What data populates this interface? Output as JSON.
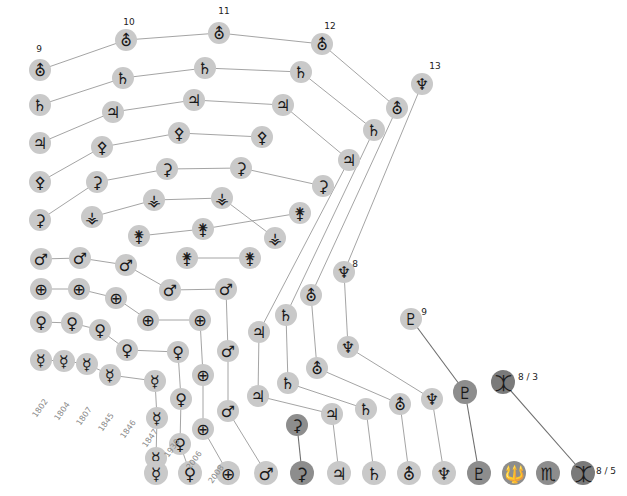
{
  "figure": {
    "type": "diagram-timeline-graph"
  },
  "glyphs": {
    "mercury": "☿",
    "venus": "♀",
    "earth": "⊕",
    "mars": "♂",
    "vesta": "⚶",
    "juno": "⚵",
    "pallas": "⚴",
    "ceres": "⚳",
    "jupiter": "♃",
    "saturn": "♄",
    "uranus": "⛢",
    "neptune": "♆",
    "pluto": "♇",
    "haumea": "🔱",
    "makemake": "♏",
    "eris": "⯰"
  },
  "glyph_names": {
    "mercury": "mercury-symbol",
    "venus": "venus-symbol",
    "earth": "earth-symbol",
    "mars": "mars-symbol",
    "vesta": "vesta-symbol",
    "juno": "juno-symbol",
    "pallas": "pallas-symbol",
    "ceres": "ceres-symbol",
    "jupiter": "jupiter-symbol",
    "saturn": "saturn-symbol",
    "uranus": "uranus-symbol",
    "neptune": "neptune-symbol",
    "pluto": "pluto-symbol",
    "haumea": "haumea-symbol",
    "makemake": "makemake-symbol",
    "eris": "eris-symbol"
  },
  "years": [
    {
      "text": "1802",
      "x": 46,
      "y": 400
    },
    {
      "text": "1804",
      "x": 68,
      "y": 403
    },
    {
      "text": "1807",
      "x": 90,
      "y": 408
    },
    {
      "text": "1845",
      "x": 112,
      "y": 414
    },
    {
      "text": "1846",
      "x": 134,
      "y": 421
    },
    {
      "text": "1847",
      "x": 156,
      "y": 430
    },
    {
      "text": "1930",
      "x": 178,
      "y": 440
    },
    {
      "text": "2006",
      "x": 200,
      "y": 452
    },
    {
      "text": "2008",
      "x": 222,
      "y": 466
    }
  ],
  "counts": [
    {
      "text": "9",
      "x": 39,
      "y": 49
    },
    {
      "text": "10",
      "x": 129,
      "y": 22
    },
    {
      "text": "11",
      "x": 224,
      "y": 11
    },
    {
      "text": "12",
      "x": 330,
      "y": 26
    },
    {
      "text": "13",
      "x": 435,
      "y": 66
    },
    {
      "text": "8",
      "x": 355,
      "y": 264
    },
    {
      "text": "9",
      "x": 424,
      "y": 312
    },
    {
      "text": "8 / 3",
      "x": 528,
      "y": 377
    },
    {
      "text": "8 / 5",
      "x": 606,
      "y": 471
    }
  ],
  "nodes": [
    {
      "id": "u9",
      "glyph": "uranus",
      "x": 40,
      "y": 70,
      "r": 11,
      "tone": "light"
    },
    {
      "id": "s9",
      "glyph": "saturn",
      "x": 40,
      "y": 105,
      "r": 11,
      "tone": "light"
    },
    {
      "id": "j9",
      "glyph": "jupiter",
      "x": 40,
      "y": 143,
      "r": 11,
      "tone": "light"
    },
    {
      "id": "p9",
      "glyph": "pallas",
      "x": 40,
      "y": 182,
      "r": 11,
      "tone": "light"
    },
    {
      "id": "c9",
      "glyph": "ceres",
      "x": 40,
      "y": 220,
      "r": 11,
      "tone": "light"
    },
    {
      "id": "m9",
      "glyph": "mars",
      "x": 41,
      "y": 259,
      "r": 11,
      "tone": "light"
    },
    {
      "id": "e9",
      "glyph": "earth",
      "x": 41,
      "y": 289,
      "r": 11,
      "tone": "light"
    },
    {
      "id": "v9",
      "glyph": "venus",
      "x": 41,
      "y": 322,
      "r": 11,
      "tone": "light"
    },
    {
      "id": "me9",
      "glyph": "mercury",
      "x": 41,
      "y": 360,
      "r": 11,
      "tone": "light"
    },
    {
      "id": "u10",
      "glyph": "uranus",
      "x": 126,
      "y": 40,
      "r": 11,
      "tone": "light"
    },
    {
      "id": "s10",
      "glyph": "saturn",
      "x": 123,
      "y": 78,
      "r": 11,
      "tone": "light"
    },
    {
      "id": "j10",
      "glyph": "jupiter",
      "x": 113,
      "y": 112,
      "r": 11,
      "tone": "light"
    },
    {
      "id": "p10",
      "glyph": "pallas",
      "x": 102,
      "y": 147,
      "r": 11,
      "tone": "light"
    },
    {
      "id": "c10",
      "glyph": "ceres",
      "x": 97,
      "y": 182,
      "r": 11,
      "tone": "light"
    },
    {
      "id": "ve10",
      "glyph": "vesta",
      "x": 92,
      "y": 217,
      "r": 11,
      "tone": "light"
    },
    {
      "id": "m10",
      "glyph": "mars",
      "x": 80,
      "y": 258,
      "r": 11,
      "tone": "light"
    },
    {
      "id": "e10",
      "glyph": "earth",
      "x": 79,
      "y": 289,
      "r": 11,
      "tone": "light"
    },
    {
      "id": "v10",
      "glyph": "venus",
      "x": 72,
      "y": 323,
      "r": 11,
      "tone": "light"
    },
    {
      "id": "me10",
      "glyph": "mercury",
      "x": 64,
      "y": 361,
      "r": 11,
      "tone": "light"
    },
    {
      "id": "u11",
      "glyph": "uranus",
      "x": 219,
      "y": 33,
      "r": 11,
      "tone": "light"
    },
    {
      "id": "s11",
      "glyph": "saturn",
      "x": 205,
      "y": 68,
      "r": 11,
      "tone": "light"
    },
    {
      "id": "j11",
      "glyph": "jupiter",
      "x": 194,
      "y": 100,
      "r": 11,
      "tone": "light"
    },
    {
      "id": "p11",
      "glyph": "pallas",
      "x": 179,
      "y": 133,
      "r": 11,
      "tone": "light"
    },
    {
      "id": "c11",
      "glyph": "ceres",
      "x": 167,
      "y": 169,
      "r": 11,
      "tone": "light"
    },
    {
      "id": "ve11",
      "glyph": "vesta",
      "x": 154,
      "y": 200,
      "r": 11,
      "tone": "light"
    },
    {
      "id": "ju11",
      "glyph": "juno",
      "x": 139,
      "y": 236,
      "r": 11,
      "tone": "light"
    },
    {
      "id": "m11",
      "glyph": "mars",
      "x": 126,
      "y": 265,
      "r": 11,
      "tone": "light"
    },
    {
      "id": "e11",
      "glyph": "earth",
      "x": 116,
      "y": 298,
      "r": 11,
      "tone": "light"
    },
    {
      "id": "v11",
      "glyph": "venus",
      "x": 100,
      "y": 330,
      "r": 11,
      "tone": "light"
    },
    {
      "id": "me11",
      "glyph": "mercury",
      "x": 87,
      "y": 364,
      "r": 11,
      "tone": "light"
    },
    {
      "id": "s12",
      "glyph": "saturn",
      "x": 301,
      "y": 72,
      "r": 11,
      "tone": "light"
    },
    {
      "id": "j12",
      "glyph": "jupiter",
      "x": 283,
      "y": 105,
      "r": 11,
      "tone": "light"
    },
    {
      "id": "p12",
      "glyph": "pallas",
      "x": 262,
      "y": 137,
      "r": 11,
      "tone": "light"
    },
    {
      "id": "c12",
      "glyph": "ceres",
      "x": 241,
      "y": 168,
      "r": 11,
      "tone": "light"
    },
    {
      "id": "ve12",
      "glyph": "vesta",
      "x": 222,
      "y": 198,
      "r": 11,
      "tone": "light"
    },
    {
      "id": "ju12",
      "glyph": "juno",
      "x": 203,
      "y": 229,
      "r": 11,
      "tone": "light"
    },
    {
      "id": "pa12",
      "glyph": "juno",
      "x": 187,
      "y": 258,
      "r": 11,
      "tone": "light"
    },
    {
      "id": "m12",
      "glyph": "mars",
      "x": 170,
      "y": 290,
      "r": 11,
      "tone": "light"
    },
    {
      "id": "e12",
      "glyph": "earth",
      "x": 148,
      "y": 320,
      "r": 11,
      "tone": "light"
    },
    {
      "id": "v12",
      "glyph": "venus",
      "x": 127,
      "y": 350,
      "r": 11,
      "tone": "light"
    },
    {
      "id": "me12",
      "glyph": "mercury",
      "x": 110,
      "y": 375,
      "r": 11,
      "tone": "light"
    },
    {
      "id": "u12",
      "glyph": "uranus",
      "x": 322,
      "y": 44,
      "r": 11,
      "tone": "light"
    },
    {
      "id": "n13",
      "glyph": "neptune",
      "x": 422,
      "y": 84,
      "r": 11,
      "tone": "light"
    },
    {
      "id": "u13",
      "glyph": "uranus",
      "x": 397,
      "y": 108,
      "r": 11,
      "tone": "light"
    },
    {
      "id": "s13",
      "glyph": "saturn",
      "x": 374,
      "y": 130,
      "r": 11,
      "tone": "light"
    },
    {
      "id": "j13",
      "glyph": "jupiter",
      "x": 349,
      "y": 160,
      "r": 11,
      "tone": "light"
    },
    {
      "id": "c13",
      "glyph": "ceres",
      "x": 323,
      "y": 186,
      "r": 11,
      "tone": "light"
    },
    {
      "id": "ve13",
      "glyph": "vesta",
      "x": 275,
      "y": 238,
      "r": 11,
      "tone": "light"
    },
    {
      "id": "ju13",
      "glyph": "juno",
      "x": 250,
      "y": 258,
      "r": 11,
      "tone": "light"
    },
    {
      "id": "pa13",
      "glyph": "juno",
      "x": 300,
      "y": 213,
      "r": 11,
      "tone": "light"
    },
    {
      "id": "m13",
      "glyph": "mars",
      "x": 226,
      "y": 289,
      "r": 11,
      "tone": "light"
    },
    {
      "id": "e13",
      "glyph": "earth",
      "x": 200,
      "y": 320,
      "r": 11,
      "tone": "light"
    },
    {
      "id": "v13",
      "glyph": "venus",
      "x": 178,
      "y": 352,
      "r": 11,
      "tone": "light"
    },
    {
      "id": "me13",
      "glyph": "mercury",
      "x": 155,
      "y": 381,
      "r": 11,
      "tone": "light"
    },
    {
      "id": "n8",
      "glyph": "neptune",
      "x": 344,
      "y": 272,
      "r": 11,
      "tone": "light"
    },
    {
      "id": "u8",
      "glyph": "uranus",
      "x": 311,
      "y": 295,
      "r": 11,
      "tone": "light"
    },
    {
      "id": "s8",
      "glyph": "saturn",
      "x": 286,
      "y": 315,
      "r": 11,
      "tone": "light"
    },
    {
      "id": "j8",
      "glyph": "jupiter",
      "x": 259,
      "y": 332,
      "r": 11,
      "tone": "light"
    },
    {
      "id": "m8",
      "glyph": "mars",
      "x": 228,
      "y": 351,
      "r": 11,
      "tone": "light"
    },
    {
      "id": "e8",
      "glyph": "earth",
      "x": 203,
      "y": 375,
      "r": 11,
      "tone": "light"
    },
    {
      "id": "v8",
      "glyph": "venus",
      "x": 181,
      "y": 399,
      "r": 11,
      "tone": "light"
    },
    {
      "id": "me8",
      "glyph": "mercury",
      "x": 157,
      "y": 418,
      "r": 11,
      "tone": "light"
    },
    {
      "id": "p9n",
      "glyph": "pluto",
      "x": 411,
      "y": 319,
      "r": 11,
      "tone": "light"
    },
    {
      "id": "n9",
      "glyph": "neptune",
      "x": 348,
      "y": 347,
      "r": 11,
      "tone": "light"
    },
    {
      "id": "u9b",
      "glyph": "uranus",
      "x": 317,
      "y": 368,
      "r": 11,
      "tone": "light"
    },
    {
      "id": "s9b",
      "glyph": "saturn",
      "x": 288,
      "y": 383,
      "r": 11,
      "tone": "light"
    },
    {
      "id": "j9b",
      "glyph": "jupiter",
      "x": 258,
      "y": 396,
      "r": 11,
      "tone": "light"
    },
    {
      "id": "c9b",
      "glyph": "ceres",
      "x": 297,
      "y": 425,
      "r": 11,
      "tone": "dark"
    },
    {
      "id": "m9b",
      "glyph": "mars",
      "x": 228,
      "y": 411,
      "r": 11,
      "tone": "light"
    },
    {
      "id": "e9b",
      "glyph": "earth",
      "x": 203,
      "y": 429,
      "r": 11,
      "tone": "light"
    },
    {
      "id": "v9b",
      "glyph": "venus",
      "x": 180,
      "y": 444,
      "r": 11,
      "tone": "light"
    },
    {
      "id": "me9b",
      "glyph": "mercury",
      "x": 156,
      "y": 458,
      "r": 11,
      "tone": "light"
    },
    {
      "id": "er83",
      "glyph": "eris",
      "x": 503,
      "y": 382,
      "r": 12,
      "tone": "darker"
    },
    {
      "id": "pl83",
      "glyph": "pluto",
      "x": 465,
      "y": 392,
      "r": 12,
      "tone": "dark"
    },
    {
      "id": "ne83",
      "glyph": "neptune",
      "x": 432,
      "y": 399,
      "r": 11,
      "tone": "light"
    },
    {
      "id": "ur83",
      "glyph": "uranus",
      "x": 400,
      "y": 404,
      "r": 11,
      "tone": "light"
    },
    {
      "id": "sa83",
      "glyph": "saturn",
      "x": 366,
      "y": 409,
      "r": 11,
      "tone": "light"
    },
    {
      "id": "ju83",
      "glyph": "jupiter",
      "x": 332,
      "y": 414,
      "r": 11,
      "tone": "light"
    },
    {
      "id": "bme",
      "glyph": "mercury",
      "x": 156,
      "y": 473,
      "r": 12,
      "tone": "light"
    },
    {
      "id": "bv",
      "glyph": "venus",
      "x": 190,
      "y": 473,
      "r": 12,
      "tone": "light"
    },
    {
      "id": "be",
      "glyph": "earth",
      "x": 228,
      "y": 473,
      "r": 12,
      "tone": "light"
    },
    {
      "id": "bm",
      "glyph": "mars",
      "x": 266,
      "y": 473,
      "r": 12,
      "tone": "light"
    },
    {
      "id": "bc",
      "glyph": "ceres",
      "x": 302,
      "y": 473,
      "r": 12,
      "tone": "dark"
    },
    {
      "id": "bj",
      "glyph": "jupiter",
      "x": 339,
      "y": 473,
      "r": 12,
      "tone": "light"
    },
    {
      "id": "bs",
      "glyph": "saturn",
      "x": 374,
      "y": 473,
      "r": 12,
      "tone": "light"
    },
    {
      "id": "bu",
      "glyph": "uranus",
      "x": 409,
      "y": 473,
      "r": 12,
      "tone": "light"
    },
    {
      "id": "bn",
      "glyph": "neptune",
      "x": 444,
      "y": 473,
      "r": 12,
      "tone": "light"
    },
    {
      "id": "bp",
      "glyph": "pluto",
      "x": 479,
      "y": 473,
      "r": 12,
      "tone": "dark"
    },
    {
      "id": "bh",
      "glyph": "haumea",
      "x": 514,
      "y": 473,
      "r": 12,
      "tone": "dark"
    },
    {
      "id": "bmk",
      "glyph": "makemake",
      "x": 548,
      "y": 473,
      "r": 12,
      "tone": "dark"
    },
    {
      "id": "ber",
      "glyph": "eris",
      "x": 583,
      "y": 473,
      "r": 12,
      "tone": "darker"
    }
  ],
  "edges": [
    {
      "from": "u9",
      "to": "u10",
      "tone": "light"
    },
    {
      "from": "u10",
      "to": "u11",
      "tone": "light"
    },
    {
      "from": "u11",
      "to": "u12",
      "tone": "light"
    },
    {
      "from": "u12",
      "to": "u13",
      "tone": "light"
    },
    {
      "from": "u13",
      "to": "u8",
      "tone": "light"
    },
    {
      "from": "u8",
      "to": "u9b",
      "tone": "light"
    },
    {
      "from": "u9b",
      "to": "ur83",
      "tone": "light"
    },
    {
      "from": "ur83",
      "to": "bu",
      "tone": "light"
    },
    {
      "from": "s9",
      "to": "s10",
      "tone": "light"
    },
    {
      "from": "s10",
      "to": "s11",
      "tone": "light"
    },
    {
      "from": "s11",
      "to": "s12",
      "tone": "light"
    },
    {
      "from": "s12",
      "to": "s13",
      "tone": "light"
    },
    {
      "from": "s13",
      "to": "s8",
      "tone": "light"
    },
    {
      "from": "s8",
      "to": "s9b",
      "tone": "light"
    },
    {
      "from": "s9b",
      "to": "sa83",
      "tone": "light"
    },
    {
      "from": "sa83",
      "to": "bs",
      "tone": "light"
    },
    {
      "from": "j9",
      "to": "j10",
      "tone": "light"
    },
    {
      "from": "j10",
      "to": "j11",
      "tone": "light"
    },
    {
      "from": "j11",
      "to": "j12",
      "tone": "light"
    },
    {
      "from": "j12",
      "to": "j13",
      "tone": "light"
    },
    {
      "from": "j13",
      "to": "j8",
      "tone": "light"
    },
    {
      "from": "j8",
      "to": "j9b",
      "tone": "light"
    },
    {
      "from": "j9b",
      "to": "ju83",
      "tone": "light"
    },
    {
      "from": "ju83",
      "to": "bj",
      "tone": "light"
    },
    {
      "from": "p9",
      "to": "p10",
      "tone": "light"
    },
    {
      "from": "p10",
      "to": "p11",
      "tone": "light"
    },
    {
      "from": "p11",
      "to": "p12",
      "tone": "light"
    },
    {
      "from": "c9",
      "to": "c10",
      "tone": "light"
    },
    {
      "from": "c10",
      "to": "c11",
      "tone": "light"
    },
    {
      "from": "c11",
      "to": "c12",
      "tone": "light"
    },
    {
      "from": "c12",
      "to": "c13",
      "tone": "light"
    },
    {
      "from": "c9b",
      "to": "bc",
      "tone": "dark"
    },
    {
      "from": "ve10",
      "to": "ve11",
      "tone": "light"
    },
    {
      "from": "ve11",
      "to": "ve12",
      "tone": "light"
    },
    {
      "from": "ve12",
      "to": "ve13",
      "tone": "light"
    },
    {
      "from": "ju11",
      "to": "ju12",
      "tone": "light"
    },
    {
      "from": "ju12",
      "to": "pa13",
      "tone": "light"
    },
    {
      "from": "pa12",
      "to": "ju13",
      "tone": "light"
    },
    {
      "from": "m9",
      "to": "m10",
      "tone": "light"
    },
    {
      "from": "m10",
      "to": "m11",
      "tone": "light"
    },
    {
      "from": "m11",
      "to": "m12",
      "tone": "light"
    },
    {
      "from": "m12",
      "to": "m13",
      "tone": "light"
    },
    {
      "from": "m13",
      "to": "m8",
      "tone": "light"
    },
    {
      "from": "m8",
      "to": "m9b",
      "tone": "light"
    },
    {
      "from": "m9b",
      "to": "bm",
      "tone": "light"
    },
    {
      "from": "e9",
      "to": "e10",
      "tone": "light"
    },
    {
      "from": "e10",
      "to": "e11",
      "tone": "light"
    },
    {
      "from": "e11",
      "to": "e12",
      "tone": "light"
    },
    {
      "from": "e12",
      "to": "e13",
      "tone": "light"
    },
    {
      "from": "e13",
      "to": "e8",
      "tone": "light"
    },
    {
      "from": "e8",
      "to": "e9b",
      "tone": "light"
    },
    {
      "from": "e9b",
      "to": "be",
      "tone": "light"
    },
    {
      "from": "v9",
      "to": "v10",
      "tone": "light"
    },
    {
      "from": "v10",
      "to": "v11",
      "tone": "light"
    },
    {
      "from": "v11",
      "to": "v12",
      "tone": "light"
    },
    {
      "from": "v12",
      "to": "v13",
      "tone": "light"
    },
    {
      "from": "v13",
      "to": "v8",
      "tone": "light"
    },
    {
      "from": "v8",
      "to": "v9b",
      "tone": "light"
    },
    {
      "from": "v9b",
      "to": "bv",
      "tone": "light"
    },
    {
      "from": "me9",
      "to": "me10",
      "tone": "light"
    },
    {
      "from": "me10",
      "to": "me11",
      "tone": "light"
    },
    {
      "from": "me11",
      "to": "me12",
      "tone": "light"
    },
    {
      "from": "me12",
      "to": "me13",
      "tone": "light"
    },
    {
      "from": "me13",
      "to": "me8",
      "tone": "light"
    },
    {
      "from": "me8",
      "to": "me9b",
      "tone": "light"
    },
    {
      "from": "me9b",
      "to": "bme",
      "tone": "light"
    },
    {
      "from": "n13",
      "to": "n8",
      "tone": "light"
    },
    {
      "from": "n8",
      "to": "n9",
      "tone": "light"
    },
    {
      "from": "n9",
      "to": "ne83",
      "tone": "light"
    },
    {
      "from": "ne83",
      "to": "bn",
      "tone": "light"
    },
    {
      "from": "p9n",
      "to": "pl83",
      "tone": "dark"
    },
    {
      "from": "pl83",
      "to": "bp",
      "tone": "dark"
    },
    {
      "from": "er83",
      "to": "ber",
      "tone": "dark"
    }
  ]
}
